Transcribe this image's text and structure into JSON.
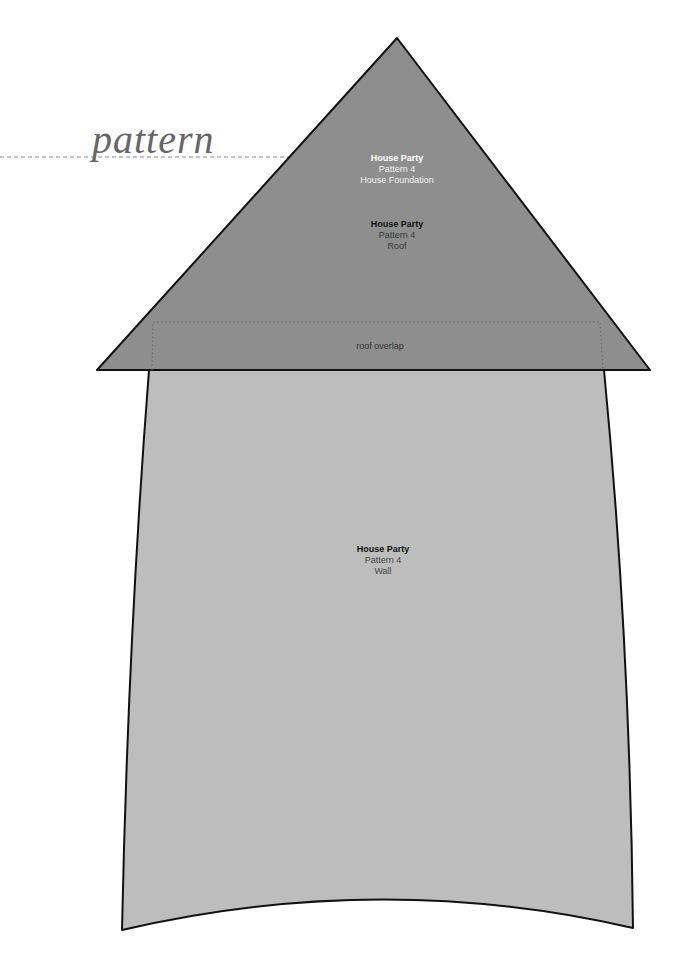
{
  "header": {
    "pattern_label": "pattern"
  },
  "pieces": {
    "foundation": {
      "title": "House Party",
      "pattern": "Pattern 4",
      "name": "House Foundation"
    },
    "roof": {
      "title": "House Party",
      "pattern": "Pattern 4",
      "name": "Roof",
      "overlap_label": "roof overlap"
    },
    "wall": {
      "title": "House Party",
      "pattern": "Pattern 4",
      "name": "Wall"
    }
  },
  "colors": {
    "roof_fill": "#8e8e8e",
    "wall_fill": "#bdbdbd",
    "outline": "#111111",
    "dashed_line": "#888888"
  }
}
